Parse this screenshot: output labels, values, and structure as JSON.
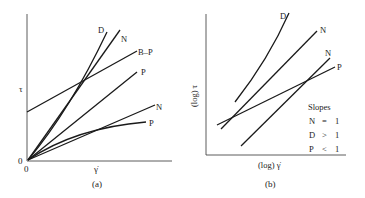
{
  "panel_a": {
    "caption": "(a)",
    "y_axis_label": "τ",
    "x_axis_label": "γ̇",
    "origin_y_label": "0",
    "origin_x_label": "0",
    "curves": [
      {
        "label": "D"
      },
      {
        "label": "N"
      },
      {
        "label": "B–P"
      },
      {
        "label": "P"
      },
      {
        "label": "N"
      },
      {
        "label": "P"
      }
    ]
  },
  "panel_b": {
    "caption": "(b)",
    "y_axis_label": "(log) τ",
    "x_axis_label": "(log) γ̇",
    "curves": [
      {
        "label": "D"
      },
      {
        "label": "N"
      },
      {
        "label": "N"
      },
      {
        "label": "P"
      }
    ],
    "legend": {
      "title": "Slopes",
      "rows": [
        {
          "sym": "N",
          "rel": "=",
          "val": "1"
        },
        {
          "sym": "D",
          "rel": ">",
          "val": "1"
        },
        {
          "sym": "P",
          "rel": "<",
          "val": "1"
        }
      ]
    }
  }
}
